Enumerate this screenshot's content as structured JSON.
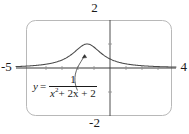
{
  "figure": {
    "title": "",
    "equation": {
      "lhs": "y",
      "equals": "=",
      "numerator": "1",
      "denominator_var": "x",
      "denominator_exponent": "2",
      "denominator_rest": "+ 2x + 2",
      "plain": "y = 1 / (x^2 + 2x + 2)"
    },
    "window_labels": {
      "xmin": "-5",
      "xmax": "4",
      "ymax": "2",
      "ymin": "-2"
    },
    "colors": {
      "curve": "#4a4a4a",
      "axis": "#3a3a3a",
      "frame": "#b8b8b8",
      "text": "#1a1a1a",
      "leader": "#4a4a4a"
    }
  },
  "chart_data": {
    "type": "line",
    "title": "",
    "subtitle": "",
    "xlabel": "",
    "ylabel": "",
    "expression": "y = 1/(x^2 + 2x + 2)",
    "xlim": [
      -5,
      4
    ],
    "ylim": [
      -2,
      2
    ],
    "grid": false,
    "legend": null,
    "axis_ticks": {
      "x": [
        -4,
        -3,
        -2,
        -1,
        0,
        1,
        2,
        3
      ],
      "y": [
        -1,
        1
      ]
    },
    "annotations": [
      {
        "text": "y = 1/(x^2 + 2x + 2)",
        "points_to_x": -1.0,
        "points_to_y": 1.0,
        "style": "curved-leader-with-arrow"
      }
    ],
    "series": [
      {
        "name": "y = 1/(x^2 + 2x + 2)",
        "x": [
          -5,
          -4.75,
          -4.5,
          -4.25,
          -4,
          -3.75,
          -3.5,
          -3.25,
          -3,
          -2.75,
          -2.5,
          -2.25,
          -2,
          -1.75,
          -1.5,
          -1.25,
          -1,
          -0.75,
          -0.5,
          -0.25,
          0,
          0.25,
          0.5,
          0.75,
          1,
          1.25,
          1.5,
          1.75,
          2,
          2.25,
          2.5,
          2.75,
          3,
          3.25,
          3.5,
          3.75,
          4
        ],
        "y": [
          0.0588,
          0.0656,
          0.0735,
          0.083,
          0.1,
          0.1084,
          0.1311,
          0.1616,
          0.2,
          0.2462,
          0.3077,
          0.3902,
          0.5,
          0.64,
          0.8,
          0.9412,
          1.0,
          0.9412,
          0.8,
          0.64,
          0.5,
          0.3902,
          0.3077,
          0.2462,
          0.2,
          0.1616,
          0.1311,
          0.1084,
          0.0909,
          0.0771,
          0.0661,
          0.0571,
          0.0588,
          0.0434,
          0.0384,
          0.0342,
          0.0385
        ]
      }
    ],
    "peak": {
      "x": -1,
      "y": 1
    }
  }
}
